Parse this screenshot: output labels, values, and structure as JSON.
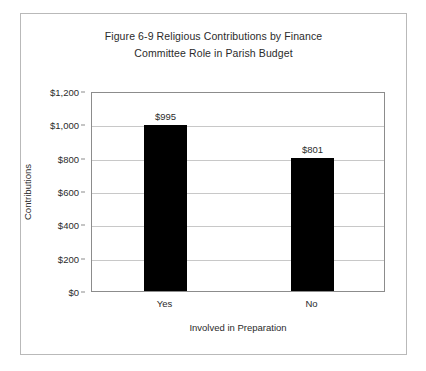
{
  "chart_data": {
    "type": "bar",
    "title": "Figure 6-9 Religious Contributions by Finance Committee Role in Parish Budget",
    "title_lines": [
      "Figure 6-9 Religious Contributions by Finance",
      "Committee Role in Parish Budget"
    ],
    "xlabel": "Involved in Preparation",
    "ylabel": "Contributions",
    "categories": [
      "Yes",
      "No"
    ],
    "values": [
      995,
      801
    ],
    "value_labels": [
      "$995",
      "$801"
    ],
    "ylim": [
      0,
      1200
    ],
    "ytick_values": [
      0,
      200,
      400,
      600,
      800,
      1000,
      1200
    ],
    "ytick_labels": [
      "$0",
      "$200",
      "$400",
      "$600",
      "$800",
      "$1,000",
      "$1,200"
    ],
    "grid": true,
    "legend": false,
    "bar_color": "#000000",
    "gridline_color": "#c8c8c8",
    "axis_color": "#8c8c8c",
    "text_color": "#2b2b2b",
    "background_color": "#ffffff"
  }
}
